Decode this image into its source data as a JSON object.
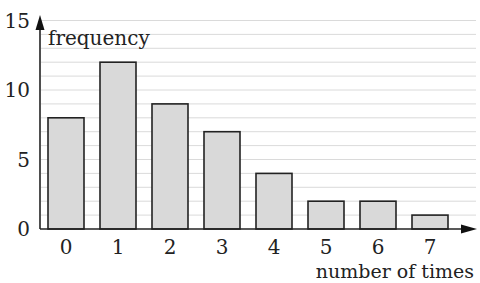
{
  "chart_data": {
    "type": "bar",
    "title": "",
    "xlabel": "number of times",
    "ylabel": "frequency",
    "categories": [
      "0",
      "1",
      "2",
      "3",
      "4",
      "5",
      "6",
      "7"
    ],
    "values": [
      8,
      12,
      9,
      7,
      4,
      2,
      2,
      1
    ],
    "ylim": [
      0,
      15
    ],
    "yticks": [
      "0",
      "5",
      "10",
      "15"
    ],
    "grid": true,
    "grid_step": 1,
    "legend": null,
    "colors": {
      "bar_fill": "#d9d9d9",
      "bar_stroke": "#222222",
      "grid": "#d0d0d0",
      "axis": "#222222"
    }
  }
}
